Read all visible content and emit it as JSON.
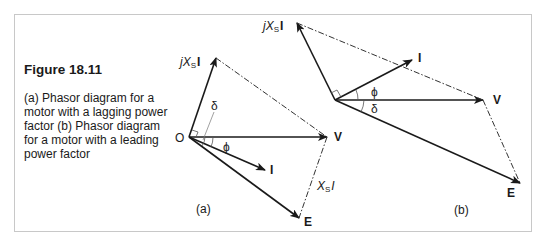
{
  "figure": {
    "title": "Figure 18.11",
    "caption": "(a) Phasor diagram for a motor with a lagging power factor (b) Phasor diagram for a  motor with a leading power factor"
  },
  "colors": {
    "line": "#1a1a1a",
    "frame": "#c8c8c8",
    "background": "#ffffff"
  },
  "diagram_a": {
    "panel_label": "(a)",
    "origin_label": "O",
    "labels": {
      "jXsI_prefix": "jX",
      "jXsI_sub": "S",
      "jXsI_suffix": "I",
      "V": "V",
      "I": "I",
      "E": "E",
      "XsI_prefix": "X",
      "XsI_sub": "S",
      "XsI_suffix": "I",
      "delta": "δ",
      "phi": "ϕ"
    }
  },
  "diagram_b": {
    "panel_label": "(b)",
    "labels": {
      "jXsI_prefix": "jX",
      "jXsI_sub": "S",
      "jXsI_suffix": "I",
      "V": "V",
      "I": "I",
      "E": "E",
      "delta": "δ",
      "phi": "ϕ"
    }
  }
}
